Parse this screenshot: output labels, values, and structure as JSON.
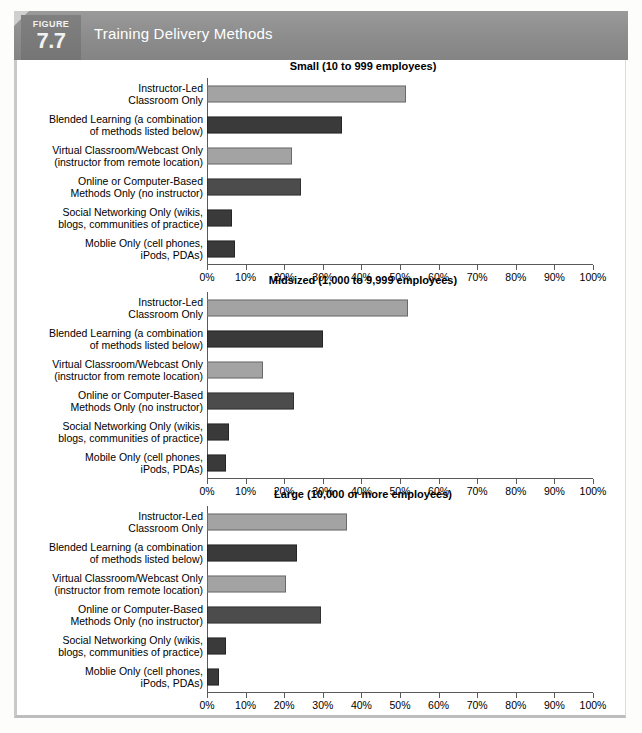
{
  "figure": {
    "kicker": "FIGURE",
    "number": "7.7",
    "title": "Training Delivery Methods"
  },
  "colors": {
    "bar_light": "#a3a3a3",
    "bar_mid": "#4c4c4c",
    "bar_dark": "#3a3a3a",
    "axis": "#5a5a5a",
    "banner": "#8e8e8e",
    "banner_tab": "#787878"
  },
  "axis": {
    "ticks": [
      "0%",
      "10%",
      "20%",
      "30%",
      "40%",
      "50%",
      "60%",
      "70%",
      "80%",
      "90%",
      "100%"
    ],
    "min": 0,
    "max": 100
  },
  "chart_data": [
    {
      "type": "bar",
      "orientation": "horizontal",
      "title": "Small (10 to 999 employees)",
      "xlabel": "",
      "ylabel": "",
      "xlim": [
        0,
        100
      ],
      "grid": false,
      "legend": "none",
      "categories": [
        "Instructor-Led\nClassroom Only",
        "Blended Learning (a combination\nof methods listed below)",
        "Virtual Classroom/Webcast Only\n(instructor from remote location)",
        "Online or Computer-Based\nMethods Only (no instructor)",
        "Social Networking Only (wikis,\nblogs, communities of practice)",
        "Moblie Only (cell phones,\niPods, PDAs)"
      ],
      "values": [
        51.5,
        35.0,
        22.0,
        24.3,
        6.5,
        7.3
      ],
      "bar_colors": [
        "#a3a3a3",
        "#3a3a3a",
        "#a3a3a3",
        "#4c4c4c",
        "#3a3a3a",
        "#3a3a3a"
      ]
    },
    {
      "type": "bar",
      "orientation": "horizontal",
      "title": "Midsized (1,000 to 9,999 employees)",
      "xlabel": "",
      "ylabel": "",
      "xlim": [
        0,
        100
      ],
      "grid": false,
      "legend": "none",
      "categories": [
        "Instructor-Led\nClassroom Only",
        "Blended Learning (a combination\nof methods listed below)",
        "Virtual Classroom/Webcast Only\n(instructor from remote location)",
        "Online or Computer-Based\nMethods Only (no instructor)",
        "Social Networking Only (wikis,\nblogs, communities of practice)",
        "Mobile Only (cell phones,\niPods, PDAs)"
      ],
      "values": [
        52.0,
        30.0,
        14.5,
        22.5,
        5.8,
        4.8
      ],
      "bar_colors": [
        "#a3a3a3",
        "#3a3a3a",
        "#a3a3a3",
        "#4c4c4c",
        "#3a3a3a",
        "#3a3a3a"
      ]
    },
    {
      "type": "bar",
      "orientation": "horizontal",
      "title": "Large (10,000 or more employees)",
      "xlabel": "",
      "ylabel": "",
      "xlim": [
        0,
        100
      ],
      "grid": false,
      "legend": "none",
      "categories": [
        "Instructor-Led\nClassroom Only",
        "Blended Learning (a combination\nof methods listed below)",
        "Virtual Classroom/Webcast Only\n(instructor from remote location)",
        "Online or Computer-Based\nMethods Only (no instructor)",
        "Social Networking Only (wikis,\nblogs, communities of practice)",
        "Moblie Only (cell phones,\niPods, PDAs)"
      ],
      "values": [
        36.3,
        23.2,
        20.5,
        29.5,
        4.8,
        3.0
      ],
      "bar_colors": [
        "#a3a3a3",
        "#3a3a3a",
        "#a3a3a3",
        "#4c4c4c",
        "#3a3a3a",
        "#3a3a3a"
      ]
    }
  ]
}
